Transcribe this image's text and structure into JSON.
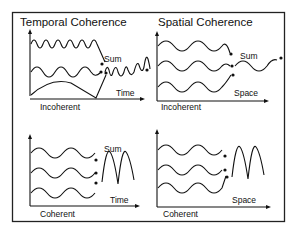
{
  "figure": {
    "panels": [
      {
        "id": "temporal-incoherent",
        "title": "Temporal Coherence",
        "axis_label": "Time",
        "sum_label": "Sum",
        "caption": "Incoherent"
      },
      {
        "id": "spatial-incoherent",
        "title": "Spatial Coherence",
        "axis_label": "Space",
        "sum_label": "Sum",
        "caption": "Incoherent"
      },
      {
        "id": "temporal-coherent",
        "title": "",
        "axis_label": "Time",
        "sum_label": "Sum",
        "caption": "Coherent"
      },
      {
        "id": "spatial-coherent",
        "title": "",
        "axis_label": "Space",
        "sum_label": "",
        "caption": "Coherent"
      }
    ],
    "colors": {
      "line": "#111111",
      "background": "#ffffff",
      "border": "#222222"
    }
  }
}
